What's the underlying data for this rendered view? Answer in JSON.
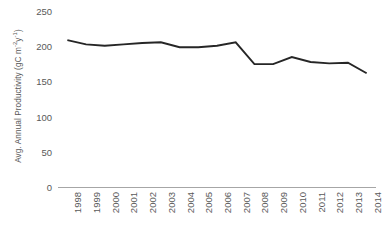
{
  "chart_data": {
    "type": "line",
    "title": "",
    "xlabel": "",
    "ylabel": "Avg. Annual Productivity (gC m",
    "ylabel_sup1": "-2",
    "ylabel_mid": "y",
    "ylabel_sup2": "-1",
    "ylabel_end": ")",
    "ylabel_full": "Avg. Annual Productivity (gC m-2y-1)",
    "categories": [
      "1998",
      "1999",
      "2000",
      "2001",
      "2002",
      "2003",
      "2004",
      "2005",
      "2006",
      "2007",
      "2008",
      "2009",
      "2010",
      "2011",
      "2012",
      "2013",
      "2014"
    ],
    "values": [
      210,
      204,
      202,
      204,
      206,
      207,
      200,
      200,
      202,
      207,
      176,
      176,
      186,
      179,
      177,
      178,
      163
    ],
    "yticks": [
      0,
      50,
      100,
      150,
      200,
      250
    ],
    "ytick_labels": [
      "0",
      "50",
      "100",
      "150",
      "200",
      "250"
    ],
    "ylim": [
      0,
      250
    ],
    "grid": false,
    "legend": null,
    "line_color": "#262626",
    "axis_color": "#a6a6a6",
    "text_color": "#595959",
    "background": "#ffffff"
  }
}
